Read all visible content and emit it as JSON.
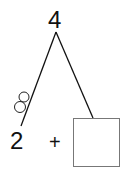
{
  "number_bond": {
    "whole": "4",
    "part_left": "2",
    "operator": "+",
    "part_right": "",
    "tally_circles": 2
  },
  "colors": {
    "stroke": "#111111",
    "box_stroke": "#777777",
    "background": "#ffffff"
  }
}
